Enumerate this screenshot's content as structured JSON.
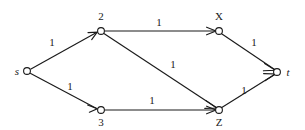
{
  "diagram": {
    "type": "directed-graph",
    "title": "",
    "canvas": {
      "width": 305,
      "height": 130
    },
    "background_color": "#ffffff",
    "stroke_color": "#1a1a1a",
    "nodes": [
      {
        "id": "s",
        "label": "s",
        "italic": true,
        "x": 27,
        "y": 71,
        "r": 3.4,
        "label_x": 17,
        "label_y": 75
      },
      {
        "id": "2",
        "label": "2",
        "italic": false,
        "x": 101,
        "y": 31,
        "r": 3.4,
        "label_x": 101,
        "label_y": 20
      },
      {
        "id": "3",
        "label": "3",
        "italic": false,
        "x": 101,
        "y": 110,
        "r": 3.4,
        "label_x": 101,
        "label_y": 126
      },
      {
        "id": "X",
        "label": "X",
        "italic": false,
        "x": 219,
        "y": 31,
        "r": 3.4,
        "label_x": 219,
        "label_y": 20
      },
      {
        "id": "Z",
        "label": "Z",
        "italic": false,
        "x": 219,
        "y": 110,
        "r": 3.4,
        "label_x": 219,
        "label_y": 126
      },
      {
        "id": "t",
        "label": "t",
        "italic": true,
        "x": 277,
        "y": 72,
        "r": 3.4,
        "label_x": 288,
        "label_y": 76
      }
    ],
    "edges": [
      {
        "id": "s-2",
        "from": "s",
        "to": "2",
        "weight": "1",
        "label_x": 52,
        "label_y": 46
      },
      {
        "id": "s-3",
        "from": "s",
        "to": "3",
        "weight": "1",
        "label_x": 70,
        "label_y": 90
      },
      {
        "id": "2-X",
        "from": "2",
        "to": "X",
        "weight": "1",
        "label_x": 159,
        "label_y": 26
      },
      {
        "id": "2-Z",
        "from": "2",
        "to": "Z",
        "weight": "1",
        "label_x": 173,
        "label_y": 68
      },
      {
        "id": "3-Z",
        "from": "3",
        "to": "Z",
        "weight": "1",
        "label_x": 152,
        "label_y": 104
      },
      {
        "id": "X-t",
        "from": "X",
        "to": "t",
        "weight": "1",
        "label_x": 254,
        "label_y": 46
      },
      {
        "id": "Z-t",
        "from": "Z",
        "to": "t",
        "weight": "1",
        "label_x": 244,
        "label_y": 94
      }
    ]
  }
}
